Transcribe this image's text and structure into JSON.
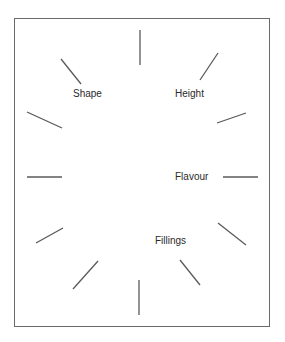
{
  "diagram": {
    "labels": {
      "shape": "Shape",
      "height": "Height",
      "flavour": "Flavour",
      "fillings": "Fillings"
    },
    "line_color": "#5a5a5a",
    "rays": [
      {
        "x1": 140,
        "y1": 30,
        "x2": 140,
        "y2": 65
      },
      {
        "x1": 218,
        "y1": 53,
        "x2": 200,
        "y2": 80
      },
      {
        "x1": 246,
        "y1": 113,
        "x2": 217,
        "y2": 123
      },
      {
        "x1": 223,
        "y1": 177,
        "x2": 258,
        "y2": 177
      },
      {
        "x1": 218,
        "y1": 223,
        "x2": 246,
        "y2": 245
      },
      {
        "x1": 180,
        "y1": 260,
        "x2": 200,
        "y2": 285
      },
      {
        "x1": 139,
        "y1": 280,
        "x2": 139,
        "y2": 315
      },
      {
        "x1": 98,
        "y1": 261,
        "x2": 73,
        "y2": 289
      },
      {
        "x1": 63,
        "y1": 228,
        "x2": 36,
        "y2": 243
      },
      {
        "x1": 27,
        "y1": 177,
        "x2": 62,
        "y2": 177
      },
      {
        "x1": 27,
        "y1": 112,
        "x2": 62,
        "y2": 128
      },
      {
        "x1": 61,
        "y1": 59,
        "x2": 81,
        "y2": 84
      }
    ]
  }
}
